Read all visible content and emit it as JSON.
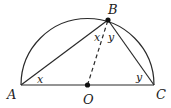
{
  "diagram": {
    "type": "geometry",
    "points": {
      "A": {
        "label": "A",
        "x": 21,
        "y": 85
      },
      "B": {
        "label": "B",
        "x": 108,
        "y": 20
      },
      "C": {
        "label": "C",
        "x": 154,
        "y": 85
      },
      "O": {
        "label": "O",
        "x": 87.5,
        "y": 85
      }
    },
    "angle_labels": {
      "at_A": "x",
      "at_B_left": "x",
      "at_B_right": "y",
      "at_C": "y"
    },
    "colors": {
      "stroke": "#2a2a2a",
      "text": "#222222",
      "background": "#ffffff"
    }
  }
}
